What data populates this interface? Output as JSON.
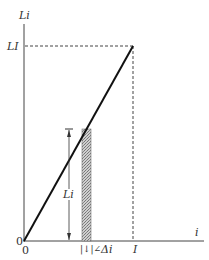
{
  "diagram": {
    "y_axis_label": "Li",
    "x_axis_label": "i",
    "y_tick_label": "LI",
    "x_tick_label": "I",
    "origin_y_label": "0",
    "origin_x_label": "0",
    "strip_height_label": "Li",
    "strip_width_label": "Δi",
    "strip_width_prefix": "|↓|∠",
    "line_color": "#111111",
    "strip_fill": "#bbbbbb"
  }
}
